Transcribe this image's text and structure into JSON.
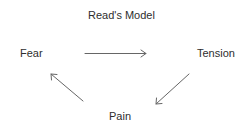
{
  "diagram": {
    "title": "Read's Model",
    "nodes": [
      {
        "id": "fear",
        "label": "Fear"
      },
      {
        "id": "tension",
        "label": "Tension"
      },
      {
        "id": "pain",
        "label": "Pain"
      }
    ],
    "edges": [
      {
        "from": "fear",
        "to": "tension"
      },
      {
        "from": "tension",
        "to": "pain"
      },
      {
        "from": "pain",
        "to": "fear"
      }
    ],
    "colors": {
      "text": "#2e2e2e",
      "arrow": "#666666",
      "background": "#ffffff"
    }
  }
}
